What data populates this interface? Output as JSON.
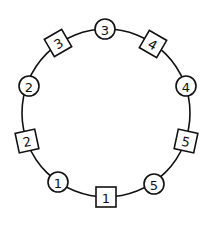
{
  "diagram": {
    "type": "ring-arrangement",
    "ring": {
      "cx": 106,
      "cy": 113,
      "r": 84,
      "stroke": "#111111"
    },
    "nodes": [
      {
        "shape": "circle",
        "label": "3",
        "x": 105,
        "y": 29
      },
      {
        "shape": "square",
        "label": "4",
        "x": 153,
        "y": 44,
        "rotate": 30
      },
      {
        "shape": "circle",
        "label": "4",
        "x": 186,
        "y": 86
      },
      {
        "shape": "square",
        "label": "5",
        "x": 186,
        "y": 141,
        "rotate": 12
      },
      {
        "shape": "circle",
        "label": "5",
        "x": 154,
        "y": 184
      },
      {
        "shape": "square",
        "label": "1",
        "x": 106,
        "y": 197,
        "rotate": 0
      },
      {
        "shape": "circle",
        "label": "1",
        "x": 58,
        "y": 182
      },
      {
        "shape": "square",
        "label": "2",
        "x": 27,
        "y": 141,
        "rotate": -12
      },
      {
        "shape": "circle",
        "label": "2",
        "x": 29,
        "y": 86
      },
      {
        "shape": "square",
        "label": "3",
        "x": 58,
        "y": 43,
        "rotate": -30
      }
    ]
  }
}
